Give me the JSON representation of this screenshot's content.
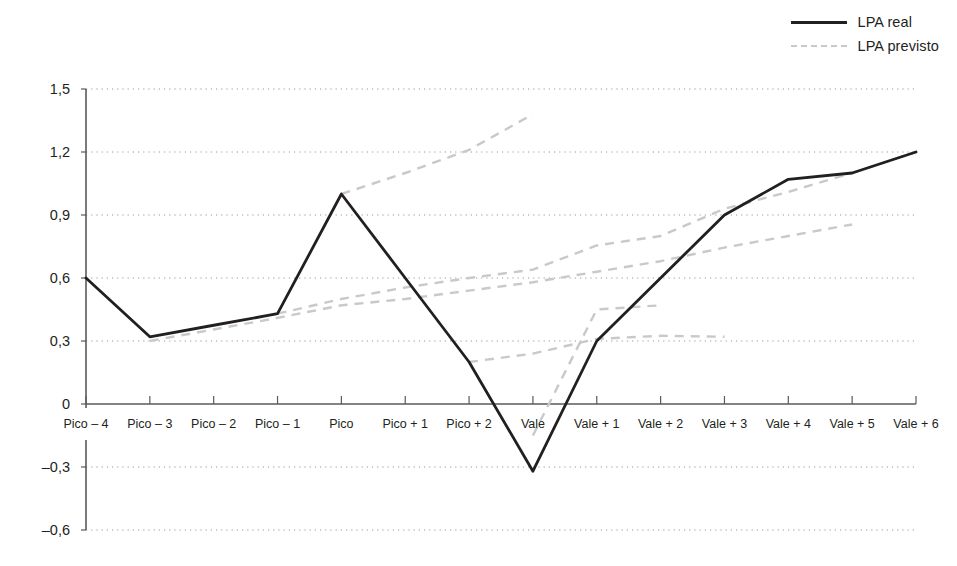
{
  "legend": {
    "position": "top-right",
    "entries": [
      {
        "label": "LPA real",
        "style": "solid",
        "color": "#231f20"
      },
      {
        "label": "LPA previsto",
        "style": "dashed",
        "color": "#c9c9c9"
      }
    ]
  },
  "chart_data": {
    "type": "line",
    "title": "",
    "subtitle": "",
    "xlabel": "",
    "ylabel": "",
    "grid": true,
    "grid_color": "#9a9a9a",
    "ylim": [
      -0.6,
      1.5
    ],
    "yticks": [
      1.5,
      1.2,
      0.9,
      0.6,
      0.3,
      0,
      -0.3,
      -0.6
    ],
    "ytick_labels": [
      "1,5",
      "1,2",
      "0,9",
      "0,6",
      "0,3",
      "0",
      "–0,3",
      "–0,6"
    ],
    "categories": [
      "Pico – 4",
      "Pico – 3",
      "Pico – 2",
      "Pico – 1",
      "Pico",
      "Pico + 1",
      "Pico + 2",
      "Vale",
      "Vale + 1",
      "Vale + 2",
      "Vale + 3",
      "Vale + 4",
      "Vale + 5",
      "Vale + 6"
    ],
    "series": [
      {
        "name": "LPA real",
        "style": "solid",
        "color": "#231f20",
        "values": [
          0.6,
          0.32,
          0.375,
          0.43,
          1.0,
          0.6,
          0.2,
          -0.32,
          0.3,
          0.6,
          0.9,
          1.07,
          1.1,
          1.2
        ]
      },
      {
        "name": "LPA previsto",
        "style": "dashed",
        "color": "#c9c9c9",
        "segments": [
          {
            "id": "forecast-from-pico-3",
            "points": [
              {
                "x": "Pico – 3",
                "y": 0.3
              },
              {
                "x": "Pico – 2",
                "y": 0.355
              },
              {
                "x": "Pico – 1",
                "y": 0.41
              },
              {
                "x": "Pico",
                "y": 0.47
              },
              {
                "x": "Pico + 1",
                "y": 0.5
              },
              {
                "x": "Pico + 2",
                "y": 0.54
              },
              {
                "x": "Vale",
                "y": 0.58
              },
              {
                "x": "Vale + 1",
                "y": 0.63
              },
              {
                "x": "Vale + 2",
                "y": 0.68
              },
              {
                "x": "Vale + 3",
                "y": 0.745
              },
              {
                "x": "Vale + 4",
                "y": 0.8
              },
              {
                "x": "Vale + 5",
                "y": 0.855
              }
            ]
          },
          {
            "id": "forecast-from-pico-1",
            "points": [
              {
                "x": "Pico – 1",
                "y": 0.43
              },
              {
                "x": "Pico",
                "y": 0.5
              },
              {
                "x": "Pico + 1",
                "y": 0.555
              },
              {
                "x": "Pico + 2",
                "y": 0.6
              },
              {
                "x": "Vale",
                "y": 0.64
              },
              {
                "x": "Vale + 1",
                "y": 0.755
              },
              {
                "x": "Vale + 2",
                "y": 0.8
              },
              {
                "x": "Vale + 3",
                "y": 0.93
              },
              {
                "x": "Vale + 4",
                "y": 1.01
              },
              {
                "x": "Vale + 5",
                "y": 1.1
              },
              {
                "x": "Vale + 6",
                "y": 1.2
              }
            ]
          },
          {
            "id": "forecast-from-pico",
            "points": [
              {
                "x": "Pico",
                "y": 1.0
              },
              {
                "x": "Pico + 1",
                "y": 1.1
              },
              {
                "x": "Pico + 2",
                "y": 1.21
              },
              {
                "x": "Vale",
                "y": 1.38
              }
            ]
          },
          {
            "id": "forecast-from-pico-plus-2",
            "points": [
              {
                "x": "Pico + 2",
                "y": 0.2
              },
              {
                "x": "Vale",
                "y": 0.24
              },
              {
                "x": "Vale + 1",
                "y": 0.31
              },
              {
                "x": "Vale + 2",
                "y": 0.325
              },
              {
                "x": "Vale + 3",
                "y": 0.32
              }
            ]
          },
          {
            "id": "forecast-from-vale",
            "points": [
              {
                "x": "Vale",
                "y": -0.15
              },
              {
                "x": "Vale + 1",
                "y": 0.45
              },
              {
                "x": "Vale + 2",
                "y": 0.47
              }
            ]
          }
        ]
      }
    ]
  }
}
